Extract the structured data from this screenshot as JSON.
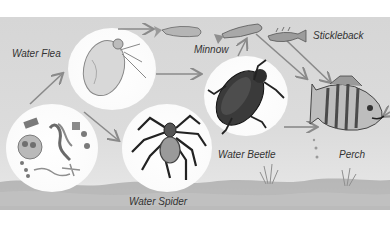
{
  "diagram": {
    "type": "food-chain",
    "title": "",
    "colors": {
      "background": "#d9d9d9",
      "circle_fill": "#ffffff",
      "arrow": "#8a8a8a",
      "label_text": "#333333",
      "ground": "#9a9a9a"
    },
    "nodes": [
      {
        "id": "plankton",
        "label": ""
      },
      {
        "id": "water-flea",
        "label": "Water Flea"
      },
      {
        "id": "water-spider",
        "label": "Water Spider"
      },
      {
        "id": "minnow",
        "label": "Minnow"
      },
      {
        "id": "stickleback",
        "label": "Stickleback"
      },
      {
        "id": "water-beetle",
        "label": "Water Beetle"
      },
      {
        "id": "perch",
        "label": "Perch"
      }
    ],
    "edges": [
      {
        "from": "plankton",
        "to": "water-flea"
      },
      {
        "from": "plankton",
        "to": "water-spider"
      },
      {
        "from": "water-flea",
        "to": "minnow"
      },
      {
        "from": "water-flea",
        "to": "water-beetle"
      },
      {
        "from": "water-beetle",
        "to": "minnow"
      },
      {
        "from": "minnow",
        "to": "perch"
      },
      {
        "from": "stickleback",
        "to": "perch"
      },
      {
        "from": "water-beetle",
        "to": "perch"
      }
    ]
  },
  "labels": {
    "water_flea": "Water Flea",
    "minnow": "Minnow",
    "stickleback": "Stickleback",
    "water_beetle": "Water Beetle",
    "perch": "Perch",
    "water_spider": "Water Spider"
  }
}
